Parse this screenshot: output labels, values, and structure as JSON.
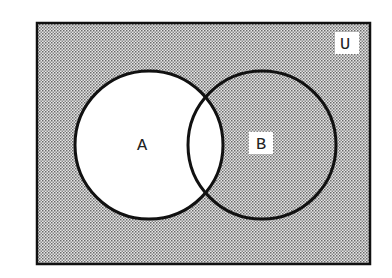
{
  "diagram": {
    "type": "venn",
    "universe_label": "U",
    "sets": [
      {
        "label": "A",
        "shaded": false
      },
      {
        "label": "B",
        "shaded": true
      }
    ],
    "shaded_region": "complement of A (U \\ A)",
    "colors": {
      "border": "#111111",
      "shade_dot": "#555555",
      "background": "#ffffff"
    }
  }
}
